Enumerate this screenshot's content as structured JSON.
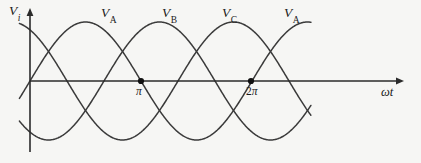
{
  "figure": {
    "width": 421,
    "height": 163,
    "background_color": "#f6f6f4",
    "ink_color": "#2b2b2b"
  },
  "axes": {
    "y_axis": {
      "label": "V",
      "label_subscript": "i",
      "x_px": 30,
      "top_px": 8,
      "bottom_px": 152,
      "has_arrow": true,
      "arrow_direction": "up"
    },
    "x_axis": {
      "label": "ωt",
      "y_px": 81,
      "left_px": 30,
      "right_px": 404,
      "has_arrow": true,
      "arrow_direction": "right"
    },
    "ticks": [
      {
        "label": "π",
        "coefficient": "",
        "symbol": "π",
        "x_px": 141,
        "value_rad": 3.14159,
        "marker": "filled-dot"
      },
      {
        "label": "2π",
        "coefficient": "2",
        "symbol": "π",
        "x_px": 251,
        "value_rad": 6.28319,
        "marker": "filled-dot"
      }
    ]
  },
  "chart_data": {
    "type": "line",
    "title": "",
    "xlabel": "ωt",
    "ylabel": "V_i",
    "grid": false,
    "legend": "inline-annotations",
    "x_unit": "radians",
    "amplitude": 1.0,
    "phase_offsets_deg": [
      0,
      120,
      240
    ],
    "x_range_rad": [
      -0.3,
      7.95
    ],
    "xlim_rad": [
      -0.3,
      10.6
    ],
    "ylim": [
      -1.25,
      1.25
    ],
    "series": [
      {
        "name": "V_A",
        "phase_deg": 0,
        "color": "#3a3a3a",
        "equation": "sin(ωt)"
      },
      {
        "name": "V_B",
        "phase_deg": 120,
        "color": "#3a3a3a",
        "equation": "sin(ωt - 2π/3)"
      },
      {
        "name": "V_C",
        "phase_deg": 240,
        "color": "#3a3a3a",
        "equation": "sin(ωt - 4π/3)"
      }
    ],
    "annotations": [
      {
        "text": "V",
        "subscript": "A",
        "x_px": 107,
        "y_px": 7
      },
      {
        "text": "V",
        "subscript": "B",
        "x_px": 168,
        "y_px": 7
      },
      {
        "text": "V",
        "subscript": "C",
        "x_px": 228,
        "y_px": 7
      },
      {
        "text": "V",
        "subscript": "A",
        "x_px": 290,
        "y_px": 7
      }
    ]
  },
  "labels": {
    "y_axis_main": "V",
    "y_axis_sub": "i",
    "x_axis": "ωt",
    "tick_pi": "π",
    "tick_two_pi_coef": "2",
    "tick_two_pi_sym": "π",
    "series_a_1": "V",
    "series_a_1_sub": "A",
    "series_b": "V",
    "series_b_sub": "B",
    "series_c": "V",
    "series_c_sub": "C",
    "series_a_2": "V",
    "series_a_2_sub": "A"
  }
}
